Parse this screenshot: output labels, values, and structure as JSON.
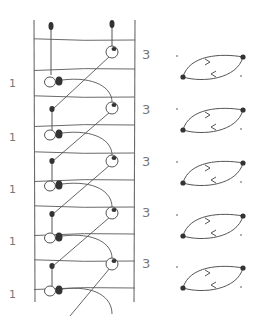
{
  "diagram": {
    "title": "",
    "ink_color": "#555555",
    "rail_color": "#6a6a6a",
    "dot_color": "#333333",
    "ladder": {
      "left_rail_x": 34,
      "right_rail_x": 135,
      "top_y": 20,
      "bottom_y": 302,
      "rungs_y": [
        40,
        69,
        97,
        125,
        153,
        180,
        207,
        234,
        261,
        288
      ]
    },
    "left_labels": [
      {
        "text": "1",
        "y": 84
      },
      {
        "text": "1",
        "y": 138
      },
      {
        "text": "1",
        "y": 190
      },
      {
        "text": "1",
        "y": 242
      },
      {
        "text": "1",
        "y": 295
      }
    ],
    "right_labels": [
      {
        "text": "3",
        "y": 55
      },
      {
        "text": "3",
        "y": 110
      },
      {
        "text": "3",
        "y": 162
      },
      {
        "text": "3",
        "y": 213
      },
      {
        "text": "3",
        "y": 264
      }
    ],
    "cycles": [
      {
        "cx": 213,
        "cy": 68
      },
      {
        "cx": 213,
        "cy": 121
      },
      {
        "cx": 213,
        "cy": 174
      },
      {
        "cx": 213,
        "cy": 227
      },
      {
        "cx": 213,
        "cy": 279
      }
    ]
  }
}
